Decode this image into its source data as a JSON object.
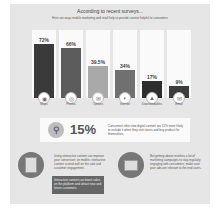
{
  "header": {
    "title": "According to recent surveys...",
    "subtitle": "Here are ways mobile marketing and retail help to provide content helpful to consumers"
  },
  "chart_data": {
    "type": "bar",
    "title": "According to recent surveys...",
    "categories": [
      "Maps",
      "Photos",
      "Options",
      "Internet",
      "Downloadables",
      "Email"
    ],
    "values": [
      72,
      66,
      39.5,
      34,
      17,
      9
    ],
    "labels": [
      "72%",
      "66%",
      "39.5%",
      "34%",
      "17%",
      "9%"
    ],
    "colors": [
      "#3a3a3a",
      "#5c5c5c",
      "#a9a9a9",
      "#707070",
      "#2e2e2e",
      "#3c3c3c"
    ],
    "ylim": [
      0,
      100
    ],
    "xlabel": "",
    "ylabel": "",
    "grid": false
  },
  "icons": [
    "map-icon",
    "camera-icon",
    "chat-icon",
    "globe-icon",
    "download-icon",
    "mail-icon"
  ],
  "stat": {
    "value": "15%",
    "text": "Consumers who view digital content are 15% more likely to include it when they visit stores and buy product for themselves."
  },
  "notes": {
    "left": "Using interactive content can improve your conversion; on mobile, interactive content scored well on the sale and customer engagement.",
    "left_box": "Interactive content can boost sales on the platform and attract new and future customers.",
    "right": "But getting above involves a lot of marketing campaigns to stay regularly engaging with consumers; make sure your ads are relevant to the end users."
  }
}
